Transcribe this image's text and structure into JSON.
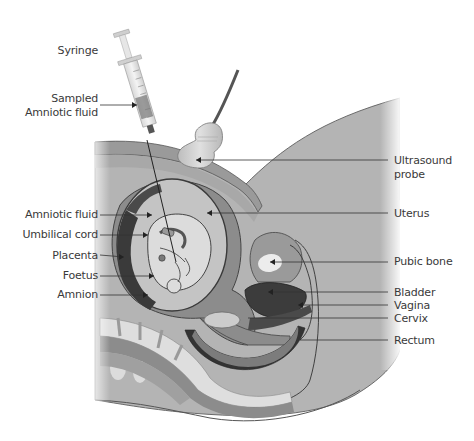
{
  "diagram": {
    "colors": {
      "background": "#ffffff",
      "body_tissue": "#b4b4b4",
      "abdominal_wall": "#9a9a9a",
      "uterus_wall": "#8a8a8a",
      "amniotic_fluid": "#c4c4c4",
      "placenta": "#3a3a3a",
      "foetus": "#dcdcdc",
      "bone": "#e6e6e6",
      "dark_organ": "#3c3c3c",
      "label_text": "#3a3a3a",
      "leader_line": "#333333"
    },
    "labels_left": [
      {
        "id": "syringe",
        "text": "Syringe"
      },
      {
        "id": "sampled-fluid-1",
        "text": "Sampled"
      },
      {
        "id": "sampled-fluid-2",
        "text": "Amniotic fluid"
      },
      {
        "id": "amniotic-fluid",
        "text": "Amniotic fluid"
      },
      {
        "id": "umbilical-cord",
        "text": "Umbilical cord"
      },
      {
        "id": "placenta",
        "text": "Placenta"
      },
      {
        "id": "foetus",
        "text": "Foetus"
      },
      {
        "id": "amnion",
        "text": "Amnion"
      }
    ],
    "labels_right": [
      {
        "id": "ultrasound-probe-1",
        "text": "Ultrasound"
      },
      {
        "id": "ultrasound-probe-2",
        "text": "probe"
      },
      {
        "id": "uterus",
        "text": "Uterus"
      },
      {
        "id": "pubic-bone",
        "text": "Pubic bone"
      },
      {
        "id": "bladder",
        "text": "Bladder"
      },
      {
        "id": "vagina",
        "text": "Vagina"
      },
      {
        "id": "cervix",
        "text": "Cervix"
      },
      {
        "id": "rectum",
        "text": "Rectum"
      }
    ]
  }
}
